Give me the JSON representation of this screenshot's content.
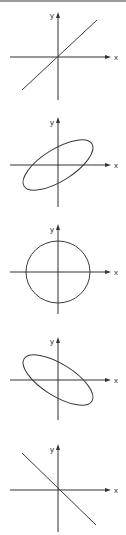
{
  "figure": {
    "axis_labels": {
      "x": "x",
      "y": "y"
    },
    "colors": {
      "stroke": "#3a3a3a",
      "axis": "#333333",
      "background": "#ffffff",
      "border": "#9a9a9a"
    },
    "panels": [
      {
        "id": "in-phase-line",
        "shape": "line",
        "slope": "positive",
        "label_x": "x",
        "label_y": "y"
      },
      {
        "id": "positive-tilt-ellipse",
        "shape": "ellipse",
        "tilt": "positive",
        "label_x": "x",
        "label_y": "y"
      },
      {
        "id": "circle",
        "shape": "circle",
        "label_x": "x",
        "label_y": "y"
      },
      {
        "id": "negative-tilt-ellipse",
        "shape": "ellipse",
        "tilt": "negative",
        "label_x": "x",
        "label_y": "y"
      },
      {
        "id": "anti-phase-line",
        "shape": "line",
        "slope": "negative",
        "label_x": "x",
        "label_y": "y"
      }
    ]
  }
}
